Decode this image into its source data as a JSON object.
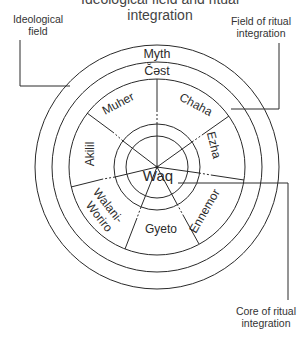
{
  "cropped_caption": "Ideological field and ritual integration",
  "labels": {
    "ideological_field": [
      "Ideological",
      "field"
    ],
    "field_of_ritual_integration": [
      "Field of ritual",
      "integration"
    ],
    "core_of_ritual_integration": [
      "Core of ritual",
      "integration"
    ]
  },
  "rings": {
    "outer": "Myth",
    "second": "Čəst",
    "core": "Waq"
  },
  "sectors": [
    {
      "name": "Muher"
    },
    {
      "name": "Chaha"
    },
    {
      "name": "Ezha"
    },
    {
      "name": "Ennemor"
    },
    {
      "name": "Gyeto"
    },
    {
      "name": "Walani-Woriro",
      "lines": [
        "Walani-",
        "Woriro"
      ]
    },
    {
      "name": "Akilil"
    }
  ],
  "colors": {
    "ink": "#2a2a2a",
    "background": "#ffffff"
  }
}
